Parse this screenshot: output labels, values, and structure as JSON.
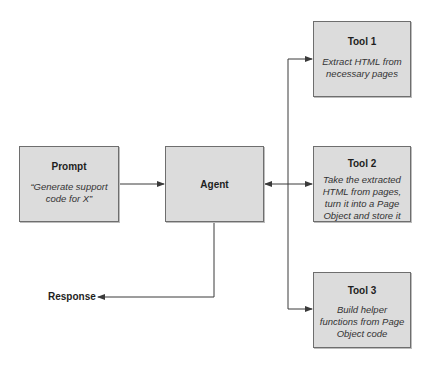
{
  "nodes": {
    "prompt": {
      "title": "Prompt",
      "description": "“Generate support code for X”"
    },
    "agent": {
      "title": "Agent"
    },
    "tool1": {
      "title": "Tool 1",
      "description": "Extract HTML from necessary pages"
    },
    "tool2": {
      "title": "Tool 2",
      "description": "Take the extracted HTML from pages, turn it into a Page Object and store it"
    },
    "tool3": {
      "title": "Tool 3",
      "description": "Build helper functions from Page Object code"
    }
  },
  "output": {
    "label": "Response"
  },
  "edges": [
    {
      "from": "prompt",
      "to": "agent"
    },
    {
      "from": "agent",
      "to": "tool1",
      "bidirectional": true
    },
    {
      "from": "agent",
      "to": "tool2",
      "bidirectional": true
    },
    {
      "from": "agent",
      "to": "tool3",
      "bidirectional": true
    },
    {
      "from": "agent",
      "to": "response"
    }
  ],
  "colors": {
    "box_fill": "#dcdcdc",
    "box_border": "#6e6e6e",
    "line": "#3a3a3a"
  }
}
